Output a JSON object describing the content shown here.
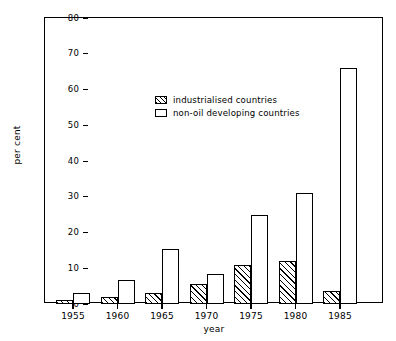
{
  "chart_data": {
    "type": "bar",
    "title": "",
    "xlabel": "year",
    "ylabel": "per cent",
    "categories": [
      "1955",
      "1960",
      "1965",
      "1970",
      "1975",
      "1980",
      "1985"
    ],
    "series": [
      {
        "name": "industrialised countries",
        "fill": "hatched",
        "values": [
          1,
          2,
          3,
          5.5,
          11,
          12,
          3.5
        ]
      },
      {
        "name": "non-oil developing countries",
        "fill": "empty",
        "values": [
          3,
          6.8,
          15.5,
          8.5,
          25,
          31,
          66
        ]
      }
    ],
    "ylim": [
      0,
      80
    ],
    "y_ticks": [
      0,
      10,
      20,
      30,
      40,
      50,
      60,
      70,
      80
    ],
    "y_tick_labels": [
      "0",
      "10",
      "20",
      "30",
      "40",
      "50",
      "60",
      "70",
      "80"
    ],
    "grid": false,
    "legend_position": "upper-center",
    "legend": [
      "industrialised countries",
      "non-oil developing countries"
    ],
    "colors": {
      "axis": "#000000",
      "bar_edge": "#000000",
      "bar_fill": "#ffffff",
      "hatch": "#000000",
      "background": "#ffffff"
    }
  }
}
